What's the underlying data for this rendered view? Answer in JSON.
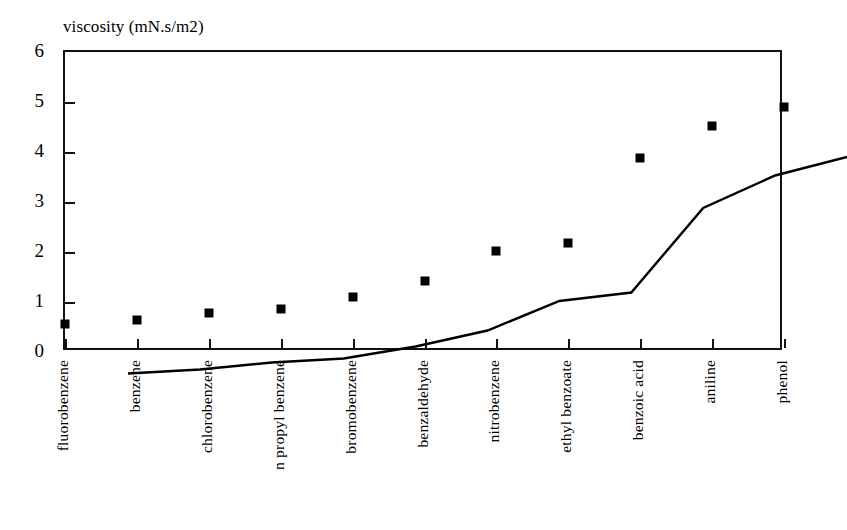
{
  "chart_data": {
    "type": "line",
    "title": "viscosity (mN.s/m2)",
    "xlabel": "",
    "ylabel": "",
    "ylim": [
      0,
      6
    ],
    "yticks": [
      0,
      1,
      2,
      3,
      4,
      5,
      6
    ],
    "ytick_labels": [
      "0",
      "1",
      "2",
      "3",
      "4",
      "5",
      "6"
    ],
    "grid": false,
    "legend": false,
    "marker": "square",
    "line_color": "#000000",
    "marker_color": "#000000",
    "background_color": "#ffffff",
    "categories": [
      "fluorobenzene",
      "benzene",
      "chlorobenzene",
      "n propyl benzene",
      "bromobenzene",
      "benzaldehyde",
      "nitrobenzene",
      "ethyl benzoate",
      "benzoic acid",
      "aniline",
      "phenol"
    ],
    "values": [
      0.57,
      0.65,
      0.79,
      0.87,
      1.11,
      1.43,
      2.02,
      2.19,
      3.88,
      4.53,
      4.9
    ]
  }
}
